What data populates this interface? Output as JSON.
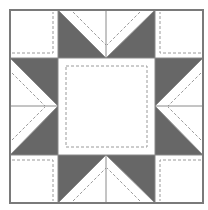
{
  "diagram": {
    "type": "quilt-block",
    "pattern": "sawtooth-star",
    "grid": {
      "cols": 4,
      "rows": 4
    },
    "colors": {
      "background": "#ffffff",
      "dark_fill": "#676767",
      "light_fill": "#ffffff",
      "outline": "#7a7a7a",
      "seam_line": "#8a8a8a",
      "dashed_line": "#9a9a9a"
    },
    "geometry": {
      "origin": [
        10,
        10
      ],
      "size": 193,
      "lines": [
        10,
        58,
        106,
        155,
        203
      ]
    },
    "regions": [
      {
        "name": "corner-top-left",
        "kind": "square",
        "fill": "light"
      },
      {
        "name": "corner-top-right",
        "kind": "square",
        "fill": "light"
      },
      {
        "name": "corner-bottom-left",
        "kind": "square",
        "fill": "light"
      },
      {
        "name": "corner-bottom-right",
        "kind": "square",
        "fill": "light"
      },
      {
        "name": "center-square",
        "kind": "square",
        "fill": "light"
      },
      {
        "name": "star-point-top",
        "kind": "flying-geese",
        "fill": "dark-sides"
      },
      {
        "name": "star-point-bottom",
        "kind": "flying-geese",
        "fill": "dark-sides"
      },
      {
        "name": "star-point-left",
        "kind": "flying-geese",
        "fill": "dark-sides"
      },
      {
        "name": "star-point-right",
        "kind": "flying-geese",
        "fill": "dark-sides"
      }
    ]
  }
}
